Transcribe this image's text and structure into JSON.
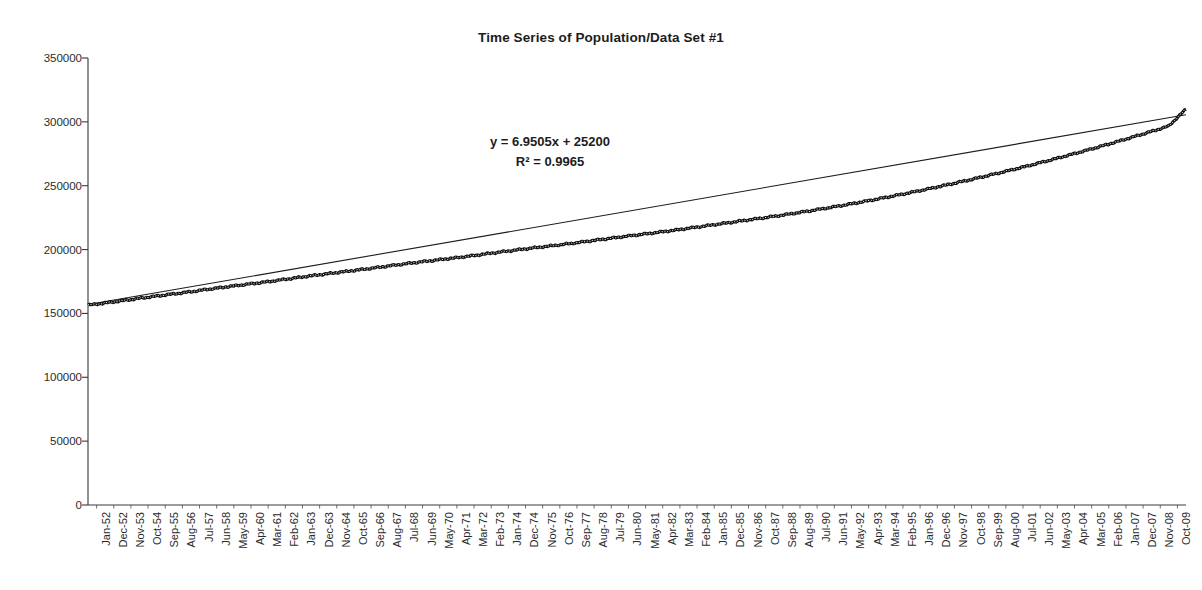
{
  "chart_data": {
    "type": "line",
    "title": "Time Series of Population/Data Set #1",
    "xlabel": "",
    "ylabel": "",
    "ylim": [
      0,
      350000
    ],
    "ytick_values": [
      0,
      50000,
      100000,
      150000,
      200000,
      250000,
      300000,
      350000
    ],
    "ytick_labels": [
      "0",
      "50000",
      "100000",
      "150000",
      "200000",
      "250000",
      "300000",
      "350000"
    ],
    "grid": false,
    "legend": "none",
    "annotations": {
      "equation": "y = 6.9505x + 25200",
      "r_squared": "R² = 0.9965"
    },
    "trendline": {
      "type": "linear",
      "slope": 6.9505,
      "intercept": 25200,
      "r2": 0.9965,
      "y_start": 157000,
      "y_end": 305500
    },
    "xtick_labels": [
      "Jan-52",
      "Dec-52",
      "Nov-53",
      "Oct-54",
      "Sep-55",
      "Aug-56",
      "Jul-57",
      "Jun-58",
      "May-59",
      "Apr-60",
      "Mar-61",
      "Feb-62",
      "Jan-63",
      "Dec-63",
      "Nov-64",
      "Oct-65",
      "Sep-66",
      "Aug-67",
      "Jul-68",
      "Jun-69",
      "May-70",
      "Apr-71",
      "Mar-72",
      "Feb-73",
      "Jan-74",
      "Dec-74",
      "Nov-75",
      "Oct-76",
      "Sep-77",
      "Aug-78",
      "Jul-79",
      "Jun-80",
      "May-81",
      "Apr-82",
      "Mar-83",
      "Feb-84",
      "Jan-85",
      "Dec-85",
      "Nov-86",
      "Oct-87",
      "Sep-88",
      "Aug-89",
      "Jul-90",
      "Jun-91",
      "May-92",
      "Apr-93",
      "Mar-94",
      "Feb-95",
      "Jan-96",
      "Dec-96",
      "Nov-97",
      "Oct-98",
      "Sep-99",
      "Aug-00",
      "Jul-01",
      "Jun-02",
      "May-03",
      "Apr-04",
      "Mar-05",
      "Feb-06",
      "Jan-07",
      "Dec-07",
      "Nov-08",
      "Oct-09"
    ],
    "series": [
      {
        "name": "Population",
        "values": [
          156500,
          158200,
          160000,
          161900,
          163700,
          165400,
          167200,
          169100,
          170900,
          172600,
          174300,
          176100,
          178000,
          179800,
          181500,
          183200,
          184900,
          186700,
          188500,
          190200,
          191800,
          193400,
          195100,
          196900,
          198700,
          200400,
          202000,
          203600,
          205300,
          207100,
          208900,
          210600,
          212300,
          214000,
          215800,
          217700,
          219600,
          221500,
          223400,
          225300,
          227300,
          229400,
          231600,
          233900,
          236300,
          238800,
          241400,
          244100,
          246900,
          249800,
          252800,
          255900,
          259100,
          262400,
          265800,
          269300,
          272900,
          276600,
          280400,
          284300,
          288300,
          292400,
          296600,
          310000
        ]
      }
    ]
  }
}
